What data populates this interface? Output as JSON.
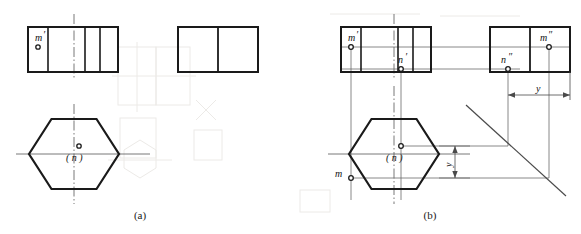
{
  "figure": {
    "title_a": "(a)",
    "title_b": "(b)",
    "background": "#ffffff",
    "ink": "#1a1a1a",
    "thin": "#444444",
    "ghost": "#ece9e6"
  },
  "panel_a": {
    "caption": "(a)",
    "front_view": {
      "name": "front-view-rectangle",
      "x": 28,
      "y": 27,
      "w": 90,
      "h": 45,
      "dividers": [
        20,
        57,
        72
      ]
    },
    "side_view": {
      "name": "side-view-rectangle",
      "x": 178,
      "y": 27,
      "w": 80,
      "h": 45,
      "dividers": [
        40
      ]
    },
    "top_view": {
      "name": "top-view-hexagon",
      "cx": 74,
      "cy": 154,
      "rx": 45,
      "ry": 40
    },
    "labels": [
      {
        "id": "m-prime-a",
        "text": "m",
        "prime": "′",
        "x": 36,
        "y": 41
      },
      {
        "id": "n-paren-a",
        "text": "( n )",
        "x": 67,
        "y": 161
      }
    ],
    "points": [
      {
        "id": "point-m-prime-a",
        "x": 38,
        "y": 47
      },
      {
        "id": "point-n-a",
        "x": 79,
        "y": 146
      }
    ]
  },
  "panel_b": {
    "caption": "(b)",
    "front_view": {
      "name": "front-view-rectangle",
      "x": 341,
      "y": 27,
      "w": 90,
      "h": 45,
      "dividers": [
        20,
        57,
        72
      ]
    },
    "side_view": {
      "name": "side-view-rectangle",
      "x": 490,
      "y": 27,
      "w": 80,
      "h": 45,
      "dividers": [
        40
      ]
    },
    "top_view": {
      "name": "top-view-hexagon",
      "cx": 394,
      "cy": 154,
      "rx": 45,
      "ry": 40
    },
    "labels": [
      {
        "id": "m-prime-b",
        "text": "m",
        "prime": "′",
        "x": 349,
        "y": 40
      },
      {
        "id": "n-prime-b",
        "text": "n",
        "prime": "′",
        "x": 399,
        "y": 62
      },
      {
        "id": "m-double-prime-b",
        "text": "m",
        "prime": "″",
        "x": 541,
        "y": 40
      },
      {
        "id": "n-double-prime-b",
        "text": "n",
        "prime": "″",
        "x": 504,
        "y": 63
      },
      {
        "id": "m-b",
        "text": "m",
        "prime": "",
        "x": 337,
        "y": 177
      },
      {
        "id": "n-paren-b",
        "text": "( n )",
        "x": 387,
        "y": 161
      }
    ],
    "dimensions": [
      {
        "id": "y-dimension-side",
        "text": "y",
        "x": 539,
        "y": 88,
        "orientation": "horizontal"
      },
      {
        "id": "y-dimension-top",
        "text": "y",
        "x": 443,
        "y": 166,
        "orientation": "vertical"
      }
    ],
    "points": [
      {
        "id": "point-m-prime-b",
        "x": 351,
        "y": 47
      },
      {
        "id": "point-n-prime-b",
        "x": 401,
        "y": 69
      },
      {
        "id": "point-m-double-prime-b",
        "x": 549,
        "y": 47
      },
      {
        "id": "point-n-double-prime-b",
        "x": 508,
        "y": 69
      },
      {
        "id": "point-m-b",
        "x": 351,
        "y": 178
      },
      {
        "id": "point-n-b",
        "x": 401,
        "y": 146
      }
    ]
  }
}
